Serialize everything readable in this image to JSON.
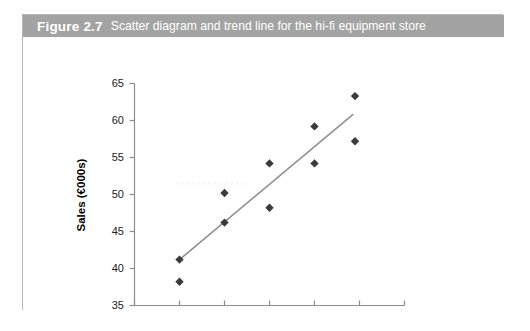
{
  "figure": {
    "number_label": "Figure 2.7",
    "caption": "Scatter diagram and trend line for the hi-fi equipment store"
  },
  "chart_data": {
    "type": "scatter",
    "title": "",
    "xlabel": "Number of Commercials",
    "ylabel": "Sales (€000s)",
    "xlim": [
      0,
      6
    ],
    "ylim": [
      35,
      65
    ],
    "xticks": [
      0,
      1,
      2,
      3,
      4,
      5,
      6
    ],
    "yticks": [
      35,
      40,
      45,
      50,
      55,
      60,
      65
    ],
    "xtick_labels": [
      "0",
      "1",
      "2",
      "3",
      "4",
      "5",
      "6"
    ],
    "ytick_labels": [
      "35",
      "40",
      "45",
      "50",
      "55",
      "60",
      "65"
    ],
    "grid": false,
    "legend": null,
    "marker_style": "diamond",
    "marker_color": "#3b3b3b",
    "points": [
      {
        "x": 1,
        "y": 41.2
      },
      {
        "x": 1,
        "y": 38.2
      },
      {
        "x": 2,
        "y": 50.2
      },
      {
        "x": 2,
        "y": 46.2
      },
      {
        "x": 3,
        "y": 54.2
      },
      {
        "x": 3,
        "y": 48.2
      },
      {
        "x": 4,
        "y": 59.2
      },
      {
        "x": 4,
        "y": 54.2
      },
      {
        "x": 4.9,
        "y": 63.3
      },
      {
        "x": 4.9,
        "y": 57.2
      }
    ],
    "series": [
      {
        "name": "Sales observations",
        "x": [
          1,
          1,
          2,
          2,
          3,
          3,
          4,
          4,
          4.9,
          4.9
        ],
        "values": [
          41.2,
          38.2,
          50.2,
          46.2,
          54.2,
          48.2,
          59.2,
          54.2,
          63.3,
          57.2
        ]
      }
    ],
    "trend_line": {
      "color": "#8f8f8f",
      "x_start": 1.0,
      "y_start": 41.2,
      "x_end": 4.85,
      "y_end": 60.8
    }
  }
}
